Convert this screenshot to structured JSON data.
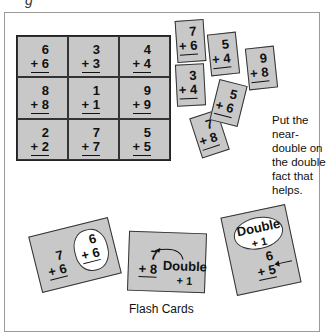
{
  "corner_glyph": "g",
  "doubles_grid": [
    {
      "top": "6",
      "bottom": "+ 6"
    },
    {
      "top": "3",
      "bottom": "+ 3"
    },
    {
      "top": "4",
      "bottom": "+ 4"
    },
    {
      "top": "8",
      "bottom": "+ 8"
    },
    {
      "top": "1",
      "bottom": "+ 1"
    },
    {
      "top": "9",
      "bottom": "+ 9"
    },
    {
      "top": "2",
      "bottom": "+ 2"
    },
    {
      "top": "7",
      "bottom": "+ 7"
    },
    {
      "top": "5",
      "bottom": "+ 5"
    }
  ],
  "near_double_cards": [
    {
      "top": "7",
      "bottom": "+ 6"
    },
    {
      "top": "5",
      "bottom": "+ 4"
    },
    {
      "top": "9",
      "bottom": "+ 8"
    },
    {
      "top": "3",
      "bottom": "+ 4"
    },
    {
      "top": "5",
      "bottom": "+ 6"
    },
    {
      "top": "7",
      "bottom": "+ 8"
    }
  ],
  "hint_text": "Put the near-double on the double fact that helps.",
  "flash_cards": {
    "card1": {
      "near": {
        "top": "7",
        "bottom": "+ 6"
      },
      "double": {
        "top": "6",
        "bottom": "+ 6"
      }
    },
    "card2": {
      "near": {
        "top": "7",
        "bottom": "+ 8"
      },
      "label_line1": "Double",
      "label_line2": "+ 1"
    },
    "card3": {
      "bubble_line1": "Double",
      "bubble_line2": "+ 1",
      "near": {
        "top": "6",
        "bottom": "+ 5"
      }
    }
  },
  "caption": "Flash Cards"
}
